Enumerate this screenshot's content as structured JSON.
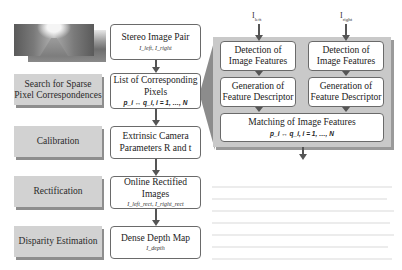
{
  "image": {
    "description": "stacked stereo street photos",
    "icon": "street-photo-icon"
  },
  "stages": [
    {
      "label": "Search for Sparse Pixel Correspondences",
      "line1": "Search for Sparse",
      "line2": "Pixel Correspondences"
    },
    {
      "label": "Calibration",
      "line1": "Calibration",
      "line2": ""
    },
    {
      "label": "Rectification",
      "line1": "Rectification",
      "line2": ""
    },
    {
      "label": "Disparity Estimation",
      "line1": "Disparity Estimation",
      "line2": ""
    }
  ],
  "flow": [
    {
      "title": "Stereo Image Pair",
      "title2": "",
      "sub": "I_left, I_right"
    },
    {
      "title": "List of Corresponding",
      "title2": "Pixels",
      "sub": "p_i ↔ q_i, i = 1, …, N"
    },
    {
      "title": "Extrinsic Camera",
      "title2": "Parameters R and t",
      "sub": ""
    },
    {
      "title": "Online Rectified Images",
      "title2": "",
      "sub": "I_left_rect, I_right_rect"
    },
    {
      "title": "Dense Depth Map",
      "title2": "",
      "sub": "I_depth"
    }
  ],
  "detail_panel": {
    "inputs": {
      "left": "I",
      "left_sub": "left",
      "right": "I",
      "right_sub": "right"
    },
    "left_column": {
      "detection": {
        "line1": "Detection of",
        "line2": "Image Features"
      },
      "generation": {
        "line1": "Generation of",
        "line2": "Feature Descriptor"
      }
    },
    "right_column": {
      "detection": {
        "line1": "Detection of",
        "line2": "Image Features"
      },
      "generation": {
        "line1": "Generation of",
        "line2": "Feature Descriptor"
      }
    },
    "matching": {
      "title": "Matching of Image Features",
      "formula": "p_i ↔ q_i, i = 1, …, N"
    }
  },
  "colors": {
    "stage_fill": "#d2d2d2",
    "stage_shadow": "#8e8e8e",
    "panel_fill": "#c9c9c9",
    "box_border": "#6a6a6a",
    "arrow": "#555555"
  }
}
